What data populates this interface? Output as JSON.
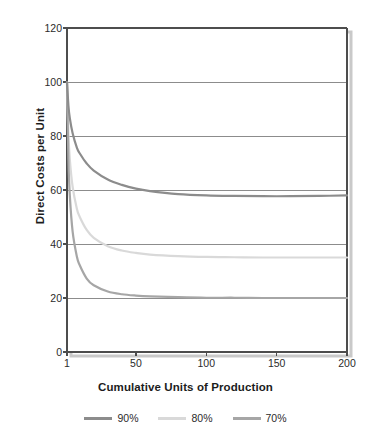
{
  "chart_data": {
    "type": "line",
    "title": "",
    "subtitle": "",
    "xlabel": "Cumulative Units of Production",
    "ylabel": "Direct Costs per Unit",
    "xlim": [
      1,
      200
    ],
    "ylim": [
      0,
      120
    ],
    "xticks": [
      "1",
      "50",
      "100",
      "150",
      "200"
    ],
    "xtick_values": [
      1,
      50,
      100,
      150,
      200
    ],
    "yticks": [
      "0",
      "20",
      "40",
      "60",
      "80",
      "100",
      "120"
    ],
    "ytick_values": [
      0,
      20,
      40,
      60,
      80,
      100,
      120
    ],
    "grid": "horizontal",
    "legend_position": "bottom",
    "x": [
      1,
      2,
      3,
      5,
      8,
      10,
      15,
      20,
      30,
      40,
      50,
      60,
      80,
      100,
      120,
      140,
      160,
      180,
      200
    ],
    "series": [
      {
        "name": "90%",
        "color": "#8c8c8c",
        "values": [
          100.0,
          91.3,
          86.6,
          81.0,
          75.7,
          73.6,
          69.8,
          67.2,
          63.9,
          61.9,
          60.5,
          59.6,
          58.5,
          58.0,
          57.8,
          57.7,
          57.7,
          57.8,
          58.0
        ]
      },
      {
        "name": "80%",
        "color": "#d9d9d9",
        "values": [
          100.0,
          80.8,
          71.4,
          61.2,
          53.1,
          50.1,
          45.2,
          42.3,
          39.2,
          37.6,
          36.7,
          36.1,
          35.5,
          35.2,
          35.1,
          35.0,
          35.0,
          35.0,
          35.0
        ]
      },
      {
        "name": "70%",
        "color": "#a6a6a6",
        "values": [
          100.0,
          71.2,
          58.0,
          44.6,
          35.4,
          32.2,
          27.2,
          24.7,
          22.4,
          21.4,
          20.9,
          20.6,
          20.3,
          20.1,
          20.1,
          20.0,
          20.0,
          20.0,
          20.0
        ]
      }
    ]
  },
  "legend": {
    "items": [
      {
        "label": "90%",
        "color": "#8c8c8c"
      },
      {
        "label": "80%",
        "color": "#d9d9d9"
      },
      {
        "label": "70%",
        "color": "#a6a6a6"
      }
    ]
  },
  "axes": {
    "y_title": "Direct Costs per Unit",
    "x_title": "Cumulative Units of Production"
  },
  "style": {
    "frame_color": "#4d4d4d",
    "grid_color": "#8c8c8c",
    "background": "#ffffff",
    "shadow_color": "#c9c9c9"
  }
}
